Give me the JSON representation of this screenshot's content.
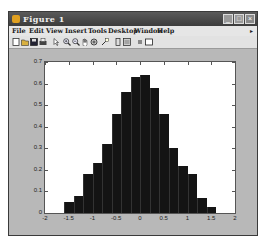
{
  "window": {
    "title": "Figure 1",
    "controls": {
      "minimize": "_",
      "maximize": "□",
      "close": "×"
    }
  },
  "menu": {
    "items": [
      "File",
      "Edit",
      "View",
      "Insert",
      "Tools",
      "Desktop",
      "Window",
      "Help"
    ],
    "overflow_arrow": "▸"
  },
  "toolbar": {
    "icons": [
      "new-figure-icon",
      "open-file-icon",
      "save-icon",
      "print-icon",
      "edit-plot-arrow-icon",
      "zoom-in-icon",
      "zoom-out-icon",
      "pan-hand-icon",
      "rotate-3d-icon",
      "data-cursor-icon",
      "insert-colorbar-icon",
      "insert-legend-icon",
      "hide-plot-tools-icon",
      "show-plot-tools-icon"
    ]
  },
  "axes": {
    "yticks": [
      "0",
      "0.1",
      "0.2",
      "0.3",
      "0.4",
      "0.5",
      "0.6",
      "0.7"
    ],
    "xticks": [
      "-2",
      "-1.5",
      "-1",
      "-0.5",
      "0",
      "0.5",
      "1",
      "1.5",
      "2"
    ]
  },
  "chart_data": {
    "type": "bar",
    "title": "",
    "xlabel": "",
    "ylabel": "",
    "xlim": [
      -2,
      2
    ],
    "ylim": [
      0,
      0.7
    ],
    "bin_width": 0.2,
    "bin_edges": [
      -1.6,
      -1.4,
      -1.2,
      -1.0,
      -0.8,
      -0.6,
      -0.4,
      -0.2,
      0.0,
      0.2,
      0.4,
      0.6,
      0.8,
      1.0,
      1.2,
      1.4,
      1.6
    ],
    "categories": [
      "-1.5",
      "-1.3",
      "-1.1",
      "-0.9",
      "-0.7",
      "-0.5",
      "-0.3",
      "-0.1",
      "0.1",
      "0.3",
      "0.5",
      "0.7",
      "0.9",
      "1.1",
      "1.3",
      "1.5"
    ],
    "values": [
      0.05,
      0.08,
      0.18,
      0.23,
      0.32,
      0.46,
      0.56,
      0.63,
      0.64,
      0.58,
      0.46,
      0.3,
      0.22,
      0.18,
      0.07,
      0.03
    ],
    "bar_color": "#141414",
    "grid": false,
    "legend": null
  }
}
